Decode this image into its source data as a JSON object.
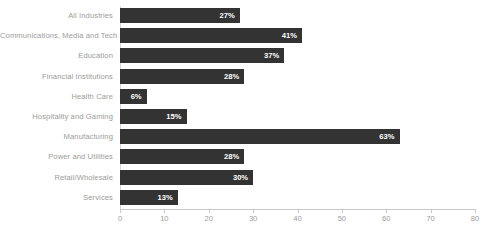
{
  "chart_data": {
    "type": "bar",
    "orientation": "horizontal",
    "title": "",
    "subtitle": "",
    "xlabel": "",
    "ylabel": "",
    "xlim": [
      0,
      80
    ],
    "xticks": [
      0,
      10,
      20,
      30,
      40,
      50,
      60,
      70,
      80
    ],
    "xtick_labels": [
      "0",
      "10",
      "20",
      "30",
      "40",
      "50",
      "60",
      "70",
      "80"
    ],
    "grid": false,
    "legend": null,
    "value_suffix": "%",
    "categories": [
      "All Industries",
      "Communications, Media and Tech",
      "Education",
      "Financial Institutions",
      "Health Care",
      "Hospitality and Gaming",
      "Manufacturing",
      "Power and Utilities",
      "Retail/Wholesale",
      "Services"
    ],
    "values": [
      27,
      41,
      37,
      28,
      6,
      15,
      63,
      28,
      30,
      13
    ],
    "data_labels": [
      "27%",
      "41%",
      "37%",
      "28%",
      "6%",
      "15%",
      "63%",
      "28%",
      "30%",
      "13%"
    ],
    "colors": {
      "bar": "#333333",
      "bar_label_text": "#ffffff",
      "category_label_text": "#9b9b9b",
      "axis_line": "#c9c9c9",
      "tick_label_text": "#9b9b9b",
      "background": "#ffffff"
    }
  }
}
